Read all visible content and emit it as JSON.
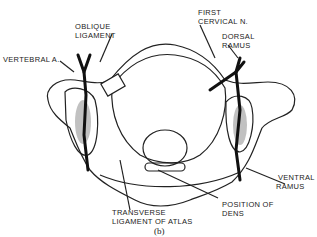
{
  "figure": {
    "caption": "(b)",
    "labels": {
      "oblique_ligament_1": "OBLIQUE",
      "oblique_ligament_2": "LIGAMENT",
      "vertebral_artery": "VERTEBRAL A.",
      "first_cervical_1": "FIRST",
      "first_cervical_2": "CERVICAL N.",
      "dorsal_ramus_1": "DORSAL",
      "dorsal_ramus_2": "RAMUS",
      "ventral_ramus_1": "VENTRAL",
      "ventral_ramus_2": "RAMUS",
      "position_dens_1": "POSITION OF",
      "position_dens_2": "DENS",
      "transverse_lig_1": "TRANSVERSE",
      "transverse_lig_2": "LIGAMENT OF ATLAS"
    }
  }
}
